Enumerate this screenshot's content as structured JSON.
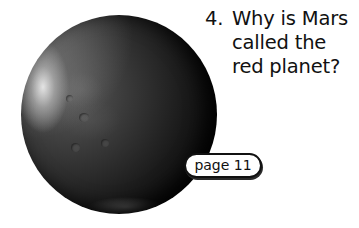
{
  "question": {
    "number": "4.",
    "lines": [
      "Why is Mars",
      "called the",
      "red planet?"
    ]
  },
  "reference_badge": {
    "label": "page 11"
  },
  "image": {
    "subject": "planet-mars",
    "style": "grayscale photo"
  }
}
